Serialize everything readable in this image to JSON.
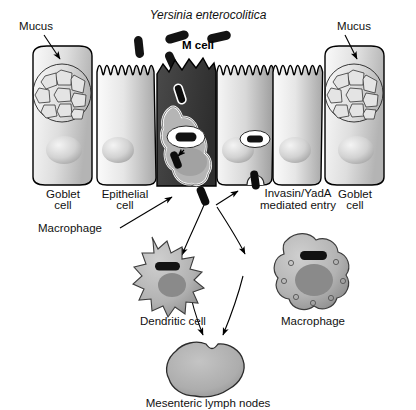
{
  "figure": {
    "title": "Yersinia enterocolitica",
    "title_style": "italic"
  },
  "labels": {
    "pathogen": "Yersinia enterocolitica",
    "m_cell": "M cell",
    "mucus_left": "Mucus",
    "mucus_right": "Mucus",
    "goblet_cell_left_line1": "Goblet",
    "goblet_cell_left_line2": "cell",
    "goblet_cell_right_line1": "Goblet",
    "goblet_cell_right_line2": "cell",
    "epithelial_cell_line1": "Epithelial",
    "epithelial_cell_line2": "cell",
    "invasin_line1": "Invasin/YadA",
    "invasin_line2": "mediated entry",
    "macrophage_pointer": "Macrophage",
    "dendritic_cell": "Dendritic cell",
    "macrophage_lower": "Macrophage",
    "lymph_nodes": "Mesenteric lymph nodes"
  },
  "colors": {
    "background": "#ffffff",
    "outline": "#000000",
    "m_cell_dark": "#3a3a3a",
    "bacteria": "#111111",
    "cell_light": "#f2f2f2",
    "cell_mid": "#c9c9c9",
    "cell_dark": "#9a9a9a",
    "nucleus": "#8f8f8f",
    "immune_cell": "#b0b0b0",
    "lymph_node": "#adadad",
    "text": "#111111"
  },
  "diagram_elements": {
    "free_bacteria_count": 5,
    "goblet_cells": 2,
    "epithelial_cells": 6,
    "m_cells": 1,
    "mucus_granules_per_goblet": 9,
    "transcytosing_macrophages": 1,
    "dendritic_cells": 1,
    "lower_macrophages": 1,
    "lymph_nodes": 1,
    "curved_arrows": 4,
    "straight_arrows": 4
  }
}
